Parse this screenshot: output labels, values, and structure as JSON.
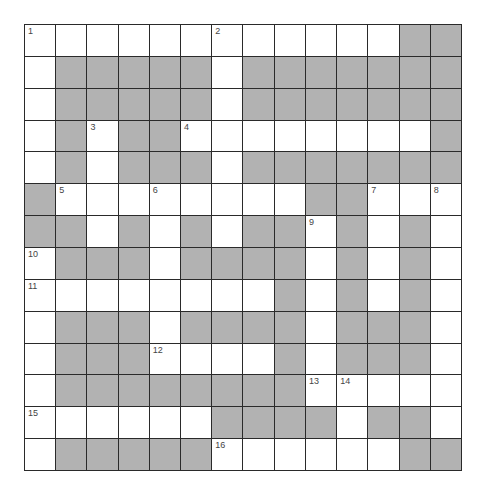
{
  "puzzle": {
    "rows": 14,
    "cols": 14,
    "colors": {
      "block": "#b2b2b2",
      "white": "#ffffff",
      "line": "#2a2a2a",
      "number": "#444444"
    },
    "layout": [
      "WWWWWWWWWWWWBB",
      "WBBBBBWBBBBBBB",
      "WBBBBBWBBBBBBB",
      "WBWBBWWWWWWWWB",
      "WBWBBBWBBBBBBB",
      "BWWWWWWWWBBWWW",
      "BBWBWBWBBWBWBW",
      "WBBBWBBBBWBWBW",
      "WWWWWWWWBWBWBW",
      "WBBBWBBBBWBBBW",
      "WBBBWWWWBWBBBW",
      "WBBBBBBBBWWWWW",
      "WWWWWWBBBBWBBW",
      "WBBBBBWWWWWWBB"
    ],
    "numbers": [
      {
        "r": 0,
        "c": 0,
        "n": "1"
      },
      {
        "r": 0,
        "c": 6,
        "n": "2"
      },
      {
        "r": 3,
        "c": 2,
        "n": "3"
      },
      {
        "r": 3,
        "c": 5,
        "n": "4"
      },
      {
        "r": 5,
        "c": 1,
        "n": "5"
      },
      {
        "r": 5,
        "c": 4,
        "n": "6"
      },
      {
        "r": 5,
        "c": 11,
        "n": "7"
      },
      {
        "r": 5,
        "c": 13,
        "n": "8"
      },
      {
        "r": 6,
        "c": 9,
        "n": "9"
      },
      {
        "r": 7,
        "c": 0,
        "n": "10"
      },
      {
        "r": 8,
        "c": 0,
        "n": "11"
      },
      {
        "r": 10,
        "c": 4,
        "n": "12"
      },
      {
        "r": 11,
        "c": 9,
        "n": "13"
      },
      {
        "r": 11,
        "c": 10,
        "n": "14"
      },
      {
        "r": 12,
        "c": 0,
        "n": "15"
      },
      {
        "r": 13,
        "c": 6,
        "n": "16"
      }
    ]
  }
}
